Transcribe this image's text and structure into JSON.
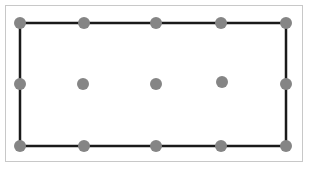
{
  "diagram": {
    "colors": {
      "edge": "#1a1a1a",
      "dot": "#858585",
      "frame": "#c8c8c8"
    },
    "rectangle": {
      "x1": 20,
      "y1": 23,
      "x2": 286,
      "y2": 146
    },
    "dots": [
      {
        "x": 20,
        "y": 23
      },
      {
        "x": 84,
        "y": 23
      },
      {
        "x": 156,
        "y": 23
      },
      {
        "x": 221,
        "y": 23
      },
      {
        "x": 286,
        "y": 23
      },
      {
        "x": 20,
        "y": 84
      },
      {
        "x": 83,
        "y": 84
      },
      {
        "x": 156,
        "y": 84
      },
      {
        "x": 222,
        "y": 82
      },
      {
        "x": 286,
        "y": 84
      },
      {
        "x": 20,
        "y": 146
      },
      {
        "x": 84,
        "y": 146
      },
      {
        "x": 156,
        "y": 146
      },
      {
        "x": 221,
        "y": 146
      },
      {
        "x": 286,
        "y": 146
      }
    ],
    "dot_radius": 6
  }
}
